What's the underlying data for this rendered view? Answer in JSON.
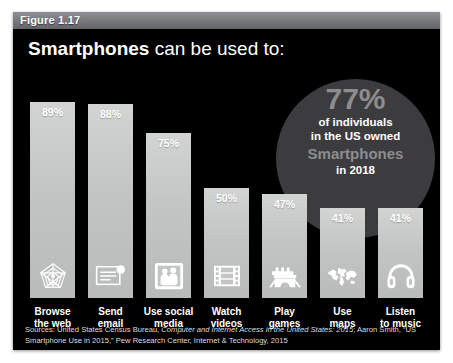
{
  "figure": {
    "header_label": "Figure 1.17",
    "title_bold": "Smartphones",
    "title_rest": " can be used to:"
  },
  "callout": {
    "percent": "77%",
    "line1": "of individuals",
    "line2": "in the US owned",
    "line3": "Smartphones",
    "line4": "in 2018"
  },
  "sources": {
    "prefix": "Sources: United States Census Bureau, ",
    "italic1": "Computer and Internet Access in the United States: 2015",
    "mid": "; Aaron Smith, “US Smartphone Use in 2015,” Pew Research Center, Internet & Technology, 2015"
  },
  "colors": {
    "background": "#000000",
    "bar": "#c6c7c7",
    "circle": "#3c3c3e",
    "circle_accent": "#8d8d90",
    "header": "#76777b",
    "text": "#ffffff"
  },
  "chart_data": {
    "type": "bar",
    "title": "Smartphones can be used to:",
    "xlabel": "",
    "ylabel": "",
    "ylim": [
      0,
      100
    ],
    "grid": false,
    "legend": "none",
    "categories": [
      "Browse the web",
      "Send email",
      "Use social media",
      "Watch videos",
      "Play games",
      "Use maps",
      "Listen to music"
    ],
    "values": [
      89,
      88,
      75,
      50,
      47,
      41,
      41
    ],
    "value_labels": [
      "89%",
      "88%",
      "75%",
      "50%",
      "47%",
      "41%",
      "41%"
    ],
    "category_lines": [
      [
        "Browse",
        "the web"
      ],
      [
        "Send",
        "email"
      ],
      [
        "Use social",
        "media"
      ],
      [
        "Watch",
        "videos"
      ],
      [
        "Play",
        "games"
      ],
      [
        "Use",
        "maps"
      ],
      [
        "Listen",
        "to music"
      ]
    ],
    "icons": [
      "globe-web-icon",
      "email-envelope-icon",
      "social-people-icon",
      "film-strip-icon",
      "game-castle-icon",
      "world-map-icon",
      "headphones-icon"
    ],
    "annotation": "77% of individuals in the US owned Smartphones in 2018"
  }
}
